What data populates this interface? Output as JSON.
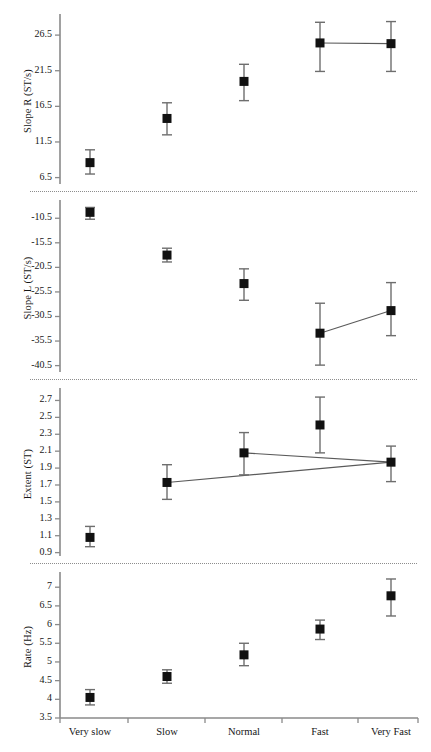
{
  "figure": {
    "categories": [
      "Very slow",
      "Slow",
      "Normal",
      "Fast",
      "Very Fast"
    ],
    "marker": "filled-square",
    "error_bar": "vertical-whisker",
    "colors": {
      "marker": "#111111",
      "error": "#6e6e6e",
      "connector": "#5a5a5a",
      "axis": "#8a8a8a",
      "separator": "#8d8d8d"
    }
  },
  "chart_data": [
    {
      "type": "scatter",
      "title": "",
      "xlabel": "",
      "ylabel": "Slope R (ST/s)",
      "categories": [
        "Very slow",
        "Slow",
        "Normal",
        "Fast",
        "Very Fast"
      ],
      "values": [
        8.6,
        14.8,
        20.0,
        25.4,
        25.3
      ],
      "err_low": [
        7.0,
        12.5,
        17.3,
        21.4,
        21.4
      ],
      "err_high": [
        10.4,
        17.0,
        22.4,
        28.3,
        28.4
      ],
      "yticks": [
        6.5,
        11.5,
        16.5,
        21.5,
        26.5
      ],
      "ylim": [
        5.6,
        28.9
      ],
      "grid": false,
      "legend": "none",
      "connectors": [
        [
          3,
          4
        ]
      ]
    },
    {
      "type": "scatter",
      "title": "",
      "xlabel": "",
      "ylabel": "Slope L (ST/s)",
      "categories": [
        "Very slow",
        "Slow",
        "Normal",
        "Fast",
        "Very Fast"
      ],
      "values": [
        -9.3,
        -18.0,
        -23.8,
        -33.9,
        -29.3
      ],
      "err_low": [
        -10.7,
        -19.4,
        -27.2,
        -40.4,
        -34.4
      ],
      "err_high": [
        -8.3,
        -16.6,
        -20.8,
        -27.8,
        -23.6
      ],
      "yticks": [
        -10.5,
        -15.5,
        -20.5,
        -25.5,
        -30.5,
        -35.5,
        -40.5
      ],
      "ylim": [
        -41.8,
        -7.6
      ],
      "grid": false,
      "legend": "none",
      "connectors": [
        [
          3,
          4
        ]
      ]
    },
    {
      "type": "scatter",
      "title": "",
      "xlabel": "",
      "ylabel": "Extent (ST)",
      "categories": [
        "Very slow",
        "Slow",
        "Normal",
        "Fast",
        "Very Fast"
      ],
      "values": [
        1.08,
        1.73,
        2.08,
        2.41,
        1.97
      ],
      "err_low": [
        0.97,
        1.53,
        1.82,
        2.08,
        1.74
      ],
      "err_high": [
        1.21,
        1.94,
        2.32,
        2.74,
        2.16
      ],
      "yticks": [
        0.9,
        1.1,
        1.3,
        1.5,
        1.7,
        1.9,
        2.1,
        2.3,
        2.5,
        2.7
      ],
      "ylim": [
        0.86,
        2.8
      ],
      "grid": false,
      "legend": "none",
      "connectors": [
        [
          1,
          4
        ],
        [
          2,
          4
        ]
      ]
    },
    {
      "type": "scatter",
      "title": "",
      "xlabel": "",
      "ylabel": "Rate (Hz)",
      "categories": [
        "Very slow",
        "Slow",
        "Normal",
        "Fast",
        "Very Fast"
      ],
      "values": [
        4.05,
        4.61,
        5.19,
        5.88,
        6.77
      ],
      "err_low": [
        3.85,
        4.43,
        4.9,
        5.6,
        6.23
      ],
      "err_high": [
        4.26,
        4.79,
        5.5,
        6.12,
        7.22
      ],
      "yticks": [
        3.5,
        4,
        4.5,
        5,
        5.5,
        6,
        6.5,
        7
      ],
      "ylim": [
        3.5,
        7.3
      ],
      "grid": false,
      "legend": "none",
      "connectors": []
    }
  ]
}
